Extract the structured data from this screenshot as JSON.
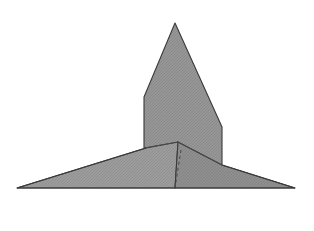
{
  "figure": {
    "canvas": {
      "width": 314,
      "height": 231,
      "background": "#ffffff"
    },
    "style": {
      "fill": "#939393",
      "fill_light": "#9a9a9a",
      "fill_dark": "#8d8d8d",
      "outline": "#3a3a3a",
      "outline_width": 1.1,
      "crease_color": "#4a4a4a",
      "crease_width": 1.0,
      "hidden_crease_color": "#4a4a4a",
      "hidden_crease_dash": "3 3",
      "texture": "halftone-dither"
    },
    "vertices": {
      "apex": [
        175,
        23
      ],
      "body_left_kink": [
        144,
        97
      ],
      "body_left_base": [
        144,
        148
      ],
      "body_right_kink": [
        222,
        127
      ],
      "body_right_base": [
        222,
        165
      ],
      "center_fold_top": [
        178,
        142
      ],
      "center_fold_left": [
        146,
        148
      ],
      "wing_left_tip": [
        17,
        188
      ],
      "wing_right_tip": [
        295,
        188
      ],
      "base_center": [
        175,
        188
      ],
      "hidden_fold_top": [
        181,
        150
      ]
    },
    "shapes": [
      {
        "name": "upright-body",
        "kind": "polygon",
        "points": "175,23 222,127 222,165 144,148 144,97",
        "tone": "fill"
      },
      {
        "name": "left-wing",
        "kind": "polygon",
        "points": "17,188 146,148 178,142 175,188",
        "tone": "fill_light"
      },
      {
        "name": "right-wing",
        "kind": "polygon",
        "points": "175,188 178,142 222,165 295,188",
        "tone": "fill_dark"
      }
    ],
    "creases": [
      {
        "name": "crease-left-fold",
        "points": "144,148 178,142",
        "hidden": false
      },
      {
        "name": "crease-right-fold",
        "points": "178,142 222,165",
        "hidden": false
      },
      {
        "name": "crease-wing-left",
        "points": "17,188 146,148",
        "hidden": false
      },
      {
        "name": "crease-wing-right",
        "points": "222,165 295,188",
        "hidden": false
      },
      {
        "name": "crease-baseline",
        "points": "17,188 295,188",
        "hidden": false
      },
      {
        "name": "crease-hidden-center",
        "points": "181,150 175,188",
        "hidden": true
      }
    ]
  }
}
